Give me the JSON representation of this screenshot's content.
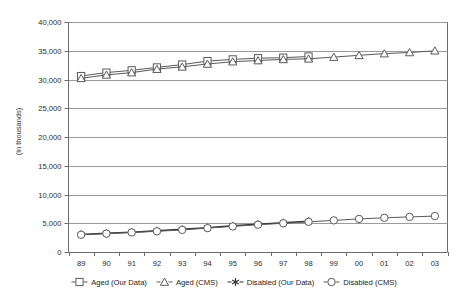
{
  "chart_data": {
    "type": "line",
    "title": "",
    "xlabel": "",
    "ylabel": "(in thousands)",
    "ylim": [
      0,
      40000
    ],
    "yticks": [
      0,
      5000,
      10000,
      15000,
      20000,
      25000,
      30000,
      35000,
      40000
    ],
    "ytick_labels": [
      "0",
      "5,000",
      "10,000",
      "15,000",
      "20,000",
      "25,000",
      "30,000",
      "35,000",
      "40,000"
    ],
    "grid": "horizontal",
    "legend_position": "bottom",
    "categories": [
      "89",
      "90",
      "91",
      "92",
      "93",
      "94",
      "95",
      "96",
      "97",
      "98",
      "99",
      "00",
      "01",
      "02",
      "03"
    ],
    "series": [
      {
        "name": "Aged (Our Data)",
        "marker": "square",
        "values": [
          30600,
          31200,
          31600,
          32100,
          32600,
          33200,
          33500,
          33700,
          33800,
          34000,
          null,
          null,
          null,
          null,
          null
        ]
      },
      {
        "name": "Aged (CMS)",
        "marker": "triangle",
        "values": [
          30200,
          30800,
          31200,
          31800,
          32200,
          32700,
          33100,
          33300,
          33500,
          33600,
          33900,
          34200,
          34500,
          34700,
          35000
        ]
      },
      {
        "name": "Disabled (Our Data)",
        "marker": "asterisk",
        "values": [
          3050,
          3250,
          3450,
          3700,
          3950,
          4250,
          4550,
          4850,
          5100,
          5350,
          null,
          null,
          null,
          null,
          null
        ]
      },
      {
        "name": "Disabled (CMS)",
        "marker": "circle",
        "values": [
          3000,
          3200,
          3400,
          3600,
          3850,
          4150,
          4450,
          4750,
          5000,
          5250,
          5500,
          5750,
          5950,
          6100,
          6250
        ]
      }
    ]
  },
  "axis": {
    "y_axis_title": "(in thousands)"
  },
  "legend": {
    "items": [
      {
        "label": "Aged (Our Data)",
        "marker": "square-marker-icon"
      },
      {
        "label": "Aged (CMS)",
        "marker": "triangle-marker-icon"
      },
      {
        "label": "Disabled (Our Data)",
        "marker": "asterisk-marker-icon"
      },
      {
        "label": "Disabled (CMS)",
        "marker": "circle-marker-icon"
      }
    ]
  },
  "colors": {
    "line": "#5a5a5a",
    "line_dark": "#2f2f2f",
    "grid": "#9b9b9b",
    "axis": "#6b6b6b",
    "text": "#1b1b1b"
  }
}
